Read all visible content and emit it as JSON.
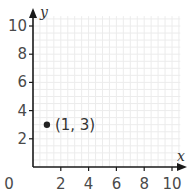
{
  "chart_data": {
    "type": "scatter",
    "title": "",
    "xlabel": "x",
    "ylabel": "y",
    "xlim": [
      0,
      10
    ],
    "ylim": [
      0,
      10
    ],
    "x_ticks": [
      "2",
      "4",
      "6",
      "8",
      "10"
    ],
    "y_ticks": [
      "2",
      "4",
      "6",
      "8",
      "10"
    ],
    "origin_label": "0",
    "grid": true,
    "points": [
      {
        "x": 1,
        "y": 3,
        "label": "(1, 3)"
      }
    ]
  },
  "colors": {
    "axis": "#1a1a1a",
    "grid": "#ececec",
    "point": "#222222",
    "text": "#4a4a4a"
  }
}
